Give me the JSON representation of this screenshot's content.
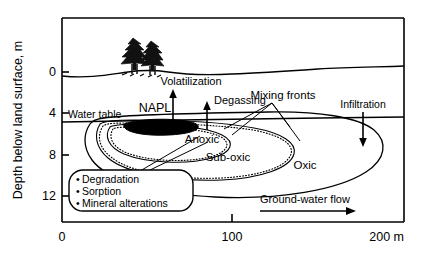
{
  "figure": {
    "type": "cross-section-diagram"
  },
  "axes": {
    "y_axis_title": "Depth below land surface, m",
    "y_ticks": [
      "0",
      "4",
      "8",
      "12"
    ],
    "y_tick_values": [
      0,
      4,
      8,
      12
    ],
    "y_range": [
      -2.5,
      15.2
    ],
    "x_ticks": [
      "0",
      "100",
      "200 m"
    ],
    "x_tick_values": [
      0,
      100,
      200
    ],
    "x_range": [
      0,
      200
    ],
    "x_unit": "m"
  },
  "labels": {
    "water_table": "Water table",
    "napl": "NAPL",
    "volatilization": "Volatilization",
    "degassing": "Degassing",
    "mixing_fronts": "Mixing fronts",
    "infiltration": "Infiltration",
    "anoxic": "Anoxic",
    "sub_oxic": "Sub-oxic",
    "oxic": "Oxic",
    "groundwater_flow": "Ground-water flow"
  },
  "callout": {
    "bullet": "•",
    "items": [
      "Degradation",
      "Sorption",
      "Mineral alterations"
    ]
  },
  "colors": {
    "line": "#000000",
    "napl_fill": "#000000",
    "background": "#ffffff"
  },
  "features": {
    "land_surface": "undulating ground surface line with two conifer trees",
    "trees_count": 2,
    "napl_lens": "black filled lens at water table",
    "zones": [
      "Anoxic",
      "Sub-oxic",
      "Oxic"
    ],
    "arrows": [
      "Volatilization (up)",
      "Degassing (up)",
      "Infiltration (down)",
      "Ground-water flow (right)"
    ]
  }
}
